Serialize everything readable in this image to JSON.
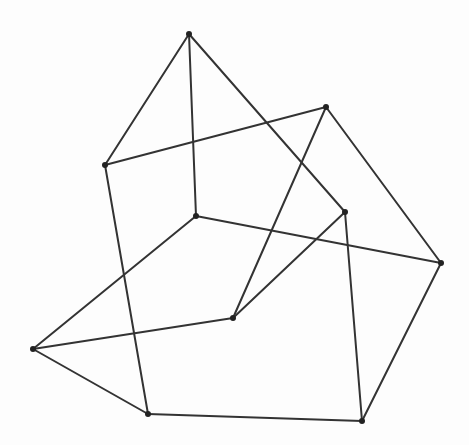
{
  "diagram": {
    "type": "graph",
    "width": 469,
    "height": 445,
    "style": {
      "edge_color": "#333333",
      "vertex_color": "#222222",
      "background": "#fdfdfd",
      "edge_width": 2,
      "vertex_radius": 3
    },
    "vertices": [
      {
        "id": "A",
        "x": 189,
        "y": 34
      },
      {
        "id": "B",
        "x": 105,
        "y": 165
      },
      {
        "id": "C",
        "x": 326,
        "y": 107
      },
      {
        "id": "D",
        "x": 196,
        "y": 216
      },
      {
        "id": "E",
        "x": 345,
        "y": 212
      },
      {
        "id": "F",
        "x": 441,
        "y": 263
      },
      {
        "id": "G",
        "x": 233,
        "y": 318
      },
      {
        "id": "H",
        "x": 33,
        "y": 349
      },
      {
        "id": "I",
        "x": 148,
        "y": 414
      },
      {
        "id": "J",
        "x": 362,
        "y": 421
      }
    ],
    "edges": [
      [
        "A",
        "B"
      ],
      [
        "A",
        "D"
      ],
      [
        "A",
        "E"
      ],
      [
        "B",
        "C"
      ],
      [
        "B",
        "I"
      ],
      [
        "C",
        "F"
      ],
      [
        "C",
        "G"
      ],
      [
        "D",
        "H"
      ],
      [
        "D",
        "F"
      ],
      [
        "E",
        "G"
      ],
      [
        "E",
        "J"
      ],
      [
        "F",
        "J"
      ],
      [
        "H",
        "G"
      ],
      [
        "H",
        "I"
      ],
      [
        "I",
        "J"
      ]
    ]
  }
}
